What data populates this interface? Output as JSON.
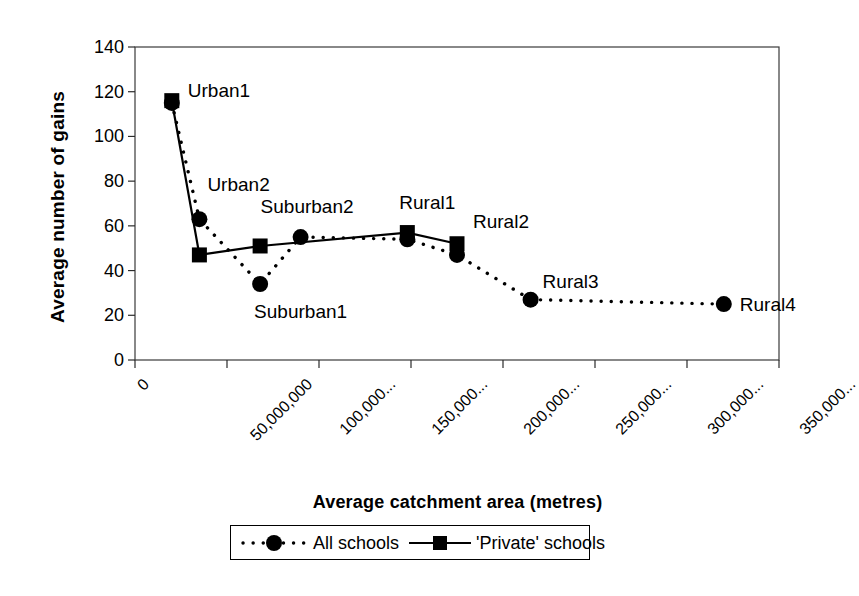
{
  "chart_data": {
    "type": "line",
    "title": "",
    "xlabel": "Average catchment area (metres)",
    "ylabel": "Average number of gains",
    "xlim": [
      0,
      350000000
    ],
    "ylim": [
      0,
      140
    ],
    "grid": false,
    "legend_position": "bottom",
    "y_ticks": [
      "0",
      "20",
      "40",
      "60",
      "80",
      "100",
      "120",
      "140"
    ],
    "y_tick_values": [
      0,
      20,
      40,
      60,
      80,
      100,
      120,
      140
    ],
    "x_ticks": [
      "0",
      "50,000,000",
      "100,000...",
      "150,000...",
      "200,000...",
      "250,000...",
      "300,000...",
      "350,000..."
    ],
    "x_tick_values": [
      0,
      50000000,
      100000000,
      150000000,
      200000000,
      250000000,
      300000000,
      350000000
    ],
    "point_labels": [
      {
        "text": "Urban1",
        "x": 20000000,
        "y": 115
      },
      {
        "text": "Urban2",
        "x": 35000000,
        "y": 63
      },
      {
        "text": "Suburban1",
        "x": 68000000,
        "y": 34
      },
      {
        "text": "Suburban2",
        "x": 90000000,
        "y": 55
      },
      {
        "text": "Rural1",
        "x": 148000000,
        "y": 56
      },
      {
        "text": "Rural2",
        "x": 175000000,
        "y": 52
      },
      {
        "text": "Rural3",
        "x": 215000000,
        "y": 27
      },
      {
        "text": "Rural4",
        "x": 320000000,
        "y": 25
      }
    ],
    "series": [
      {
        "name": "All schools",
        "marker": "circle",
        "linestyle": "dotted",
        "color": "#000000",
        "points": [
          {
            "label": "Urban1",
            "x": 20000000,
            "y": 115
          },
          {
            "label": "Urban2",
            "x": 35000000,
            "y": 63
          },
          {
            "label": "Suburban1",
            "x": 68000000,
            "y": 34
          },
          {
            "label": "Suburban2",
            "x": 90000000,
            "y": 55
          },
          {
            "label": "Rural1",
            "x": 148000000,
            "y": 54
          },
          {
            "label": "Rural2",
            "x": 175000000,
            "y": 47
          },
          {
            "label": "Rural3",
            "x": 215000000,
            "y": 27
          },
          {
            "label": "Rural4",
            "x": 320000000,
            "y": 25
          }
        ]
      },
      {
        "name": "'Private' schools",
        "marker": "square",
        "linestyle": "solid",
        "color": "#000000",
        "points": [
          {
            "label": "Urban1",
            "x": 20000000,
            "y": 116
          },
          {
            "label": "Urban2",
            "x": 35000000,
            "y": 47
          },
          {
            "label": "Suburban1",
            "x": 68000000,
            "y": 51
          },
          {
            "label": "Rural1",
            "x": 148000000,
            "y": 57
          },
          {
            "label": "Rural2",
            "x": 175000000,
            "y": 52
          }
        ]
      }
    ]
  },
  "legend": {
    "items": [
      {
        "label": "All schools",
        "marker": "circle",
        "linestyle": "dotted"
      },
      {
        "label": "'Private' schools",
        "marker": "square",
        "linestyle": "solid"
      }
    ]
  }
}
